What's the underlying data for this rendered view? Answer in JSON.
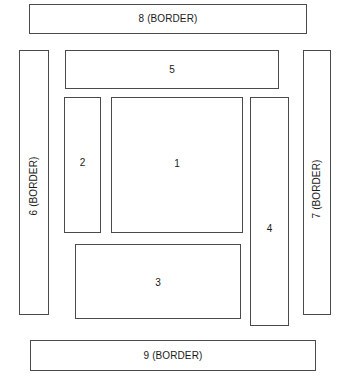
{
  "diagram": {
    "canvas": {
      "width": 346,
      "height": 378,
      "background": "#ffffff"
    },
    "stroke_color": "#4a4a4a",
    "regions": [
      {
        "id": "8",
        "label": "8 (BORDER)",
        "kind": "border",
        "orientation": "horizontal",
        "position": "top"
      },
      {
        "id": "6",
        "label": "6 (BORDER)",
        "kind": "border",
        "orientation": "vertical",
        "position": "left"
      },
      {
        "id": "7",
        "label": "7 (BORDER)",
        "kind": "border",
        "orientation": "vertical",
        "position": "right"
      },
      {
        "id": "5",
        "label": "5",
        "kind": "region",
        "orientation": "horizontal",
        "position": "inner-top"
      },
      {
        "id": "2",
        "label": "2",
        "kind": "region",
        "orientation": "vertical",
        "position": "inner-left"
      },
      {
        "id": "1",
        "label": "1",
        "kind": "region",
        "orientation": "horizontal",
        "position": "center"
      },
      {
        "id": "4",
        "label": "4",
        "kind": "region",
        "orientation": "vertical",
        "position": "inner-right"
      },
      {
        "id": "3",
        "label": "3",
        "kind": "region",
        "orientation": "horizontal",
        "position": "inner-bottom"
      },
      {
        "id": "9",
        "label": "9 (BORDER)",
        "kind": "border",
        "orientation": "horizontal",
        "position": "bottom"
      }
    ]
  }
}
